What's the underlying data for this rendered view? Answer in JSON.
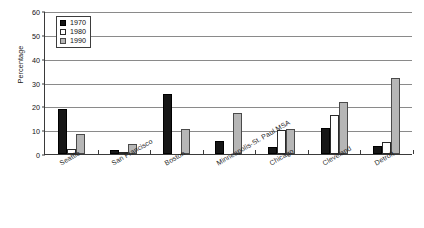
{
  "chart_data": {
    "type": "bar",
    "title": "",
    "xlabel": "",
    "ylabel": "Percentage",
    "ylim": [
      0,
      60
    ],
    "yticks": [
      0,
      10,
      20,
      30,
      40,
      50,
      60
    ],
    "grid": true,
    "legend_position": "top-left",
    "categories": [
      "Seattle",
      "San Francisco",
      "Boston",
      "Minneapolis-St. Paul MSA",
      "Chicago",
      "Cleveland",
      "Detroit"
    ],
    "series": [
      {
        "name": "1970",
        "color": "#161616",
        "values": [
          19,
          1.5,
          25,
          5.5,
          3,
          11,
          3.5
        ]
      },
      {
        "name": "1980",
        "color": "#ffffff",
        "values": [
          2,
          1,
          0,
          0,
          10,
          16.5,
          5
        ]
      },
      {
        "name": "1990",
        "color": "#b6b6b6",
        "values": [
          8.5,
          4,
          10.5,
          17,
          10.5,
          22,
          32
        ]
      }
    ]
  }
}
